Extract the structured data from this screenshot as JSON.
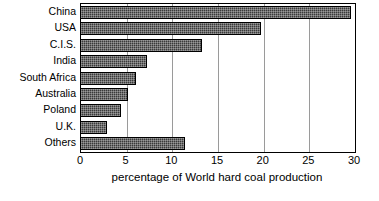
{
  "chart_data": {
    "type": "bar",
    "orientation": "horizontal",
    "title": "",
    "subtitle": "",
    "xlabel": "percentage of World hard coal production",
    "ylabel": "",
    "categories": [
      "China",
      "USA",
      "C.I.S.",
      "India",
      "South Africa",
      "Australia",
      "Poland",
      "U.K.",
      "Others"
    ],
    "values": [
      29.6,
      19.7,
      13.2,
      7.2,
      6.0,
      5.2,
      4.4,
      2.9,
      11.4
    ],
    "xlim": [
      0,
      30
    ],
    "xticks": [
      0,
      5,
      10,
      15,
      20,
      25,
      30
    ],
    "xtick_labels": [
      "0",
      "5",
      "10",
      "15",
      "20",
      "25",
      "30"
    ],
    "grid": "vertical-only",
    "legend": "none",
    "bar_color": "#3a3a3a",
    "bar_pattern": "dotted-fill",
    "axis_color": "#000000",
    "grid_color": "#9a9a9a",
    "background": "#ffffff"
  }
}
